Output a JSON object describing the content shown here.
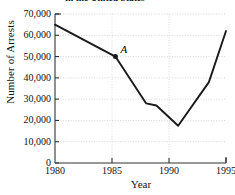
{
  "chart_data": {
    "type": "line",
    "title": "in the United States",
    "xlabel": "Year",
    "ylabel": "Number of Arrests",
    "xlim": [
      1980,
      1995
    ],
    "ylim": [
      0,
      70000
    ],
    "xticks": [
      1980,
      1985,
      1990,
      1995
    ],
    "xtick_labels": [
      "1980",
      "1985",
      "1990",
      "1995"
    ],
    "yticks": [
      0,
      10000,
      20000,
      30000,
      40000,
      50000,
      60000,
      70000
    ],
    "ytick_labels": [
      "0",
      "10,000",
      "20,000",
      "30,000",
      "40,000",
      "50,000",
      "60,000",
      "70,000"
    ],
    "grid": true,
    "legend": "none",
    "line_color": "#1a1a1a",
    "grid_color": "#c8c8c8",
    "axis_color": "#333333",
    "x": [
      1980,
      1985.3,
      1988.0,
      1988.9,
      1990.8,
      1993.5,
      1995.0
    ],
    "values": [
      65000,
      50000,
      28000,
      27000,
      17500,
      38000,
      62000
    ],
    "series": [
      {
        "name": "Number of Arrests",
        "points": [
          {
            "x": 1980,
            "y": 65000
          },
          {
            "x": 1985.3,
            "y": 50000
          },
          {
            "x": 1988.0,
            "y": 28000
          },
          {
            "x": 1988.9,
            "y": 27000
          },
          {
            "x": 1990.8,
            "y": 17500
          },
          {
            "x": 1993.5,
            "y": 38000
          },
          {
            "x": 1995.0,
            "y": 62000
          }
        ]
      }
    ],
    "annotations": [
      {
        "label": "A",
        "x": 1985.3,
        "y": 50000,
        "marker": "filled-dot"
      }
    ]
  }
}
